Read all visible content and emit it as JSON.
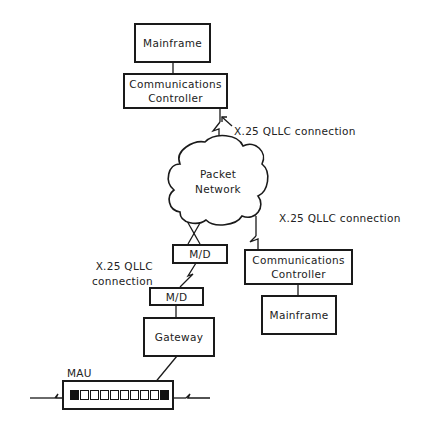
{
  "diagram": {
    "top_site": {
      "mainframe": "Mainframe",
      "controller_line1": "Communications",
      "controller_line2": "Controller"
    },
    "link_top_label": "X.25 QLLC connection",
    "network": {
      "line1": "Packet",
      "line2": "Network"
    },
    "link_right_label": "X.25 QLLC connection",
    "right_site": {
      "controller_line1": "Communications",
      "controller_line2": "Controller",
      "mainframe": "Mainframe"
    },
    "modem_top": "M/D",
    "link_left_label_line1": "X.25 QLLC",
    "link_left_label_line2": "connection",
    "modem_bottom": "M/D",
    "gateway": "Gateway",
    "mau_label": "MAU",
    "mau_ports": 10
  },
  "colors": {
    "line": "#1a1a1a",
    "background": "#ffffff"
  }
}
